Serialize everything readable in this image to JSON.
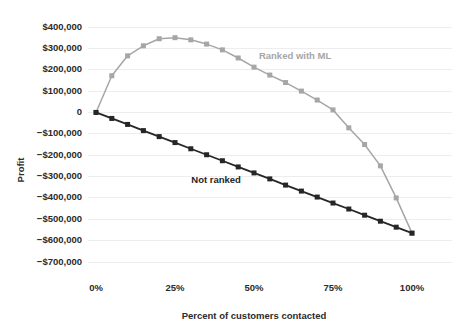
{
  "chart_data": {
    "type": "line",
    "title": "",
    "xlabel": "Percent of customers contacted",
    "ylabel": "Profit",
    "xlim": [
      0,
      100
    ],
    "ylim": [
      -700000,
      400000
    ],
    "grid": true,
    "legend_position": "inline-annotation",
    "x_tick_labels": [
      "0%",
      "25%",
      "50%",
      "75%",
      "100%"
    ],
    "x_tick_values": [
      0,
      25,
      50,
      75,
      100
    ],
    "y_tick_labels": [
      "$400,000",
      "$300,000",
      "$200,000",
      "$100,000",
      "0",
      "−$100,000",
      "−$200,000",
      "−$300,000",
      "−$400,000",
      "−$500,000",
      "−$600,000",
      "−$700,000"
    ],
    "y_tick_values": [
      400000,
      300000,
      200000,
      100000,
      0,
      -100000,
      -200000,
      -300000,
      -400000,
      -500000,
      -600000,
      -700000
    ],
    "x": [
      0,
      5,
      10,
      15,
      20,
      25,
      30,
      35,
      40,
      45,
      50,
      55,
      60,
      65,
      70,
      75,
      80,
      85,
      90,
      95,
      100
    ],
    "series": [
      {
        "name": "Ranked with ML",
        "color": "#a6a6a6",
        "label_color": "#a6a6a6",
        "marker": "square",
        "label_x": 63,
        "label_y": 250000,
        "values": [
          0,
          172000,
          265000,
          312000,
          345000,
          350000,
          340000,
          320000,
          293000,
          255000,
          212000,
          175000,
          140000,
          100000,
          58000,
          12000,
          -72000,
          -150000,
          -250000,
          -400000,
          -565000
        ]
      },
      {
        "name": "Not ranked",
        "color": "#262626",
        "label_color": "#262626",
        "marker": "square",
        "label_x": 38,
        "label_y": -330000,
        "values": [
          0,
          -28000,
          -56000,
          -85000,
          -113000,
          -141000,
          -170000,
          -198000,
          -226000,
          -255000,
          -283000,
          -311000,
          -340000,
          -368000,
          -396000,
          -424000,
          -452000,
          -481000,
          -509000,
          -537000,
          -565000
        ]
      }
    ]
  }
}
